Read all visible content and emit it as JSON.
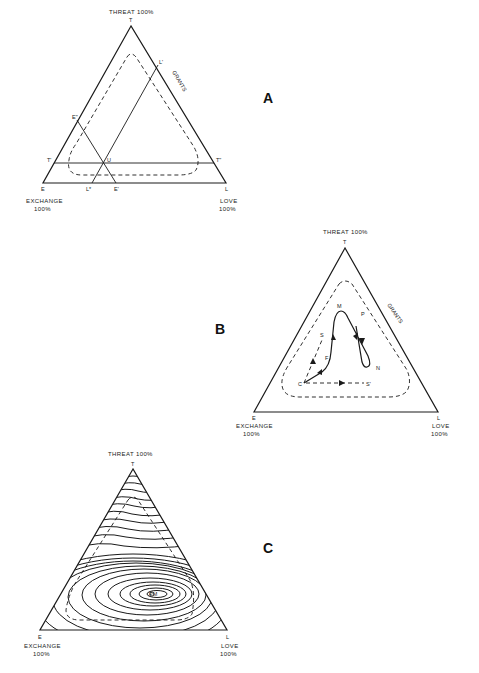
{
  "figure": {
    "panels": [
      {
        "id": "A",
        "letter": "A",
        "top_label": "THREAT 100%",
        "vertex_top": "T",
        "vertex_left": "E",
        "vertex_right": "L",
        "left_caption_1": "EXCHANGE",
        "left_caption_2": "100%",
        "right_caption_1": "LOVE",
        "right_caption_2": "100%",
        "region_label": "GRANTS",
        "points": {
          "t_prime": "T'",
          "u": "U",
          "t_double": "T\"",
          "e_double": "E\"",
          "l_prime": "L'",
          "l_star": "L*",
          "e_prime": "E'"
        }
      },
      {
        "id": "B",
        "letter": "B",
        "top_label": "THREAT 100%",
        "vertex_top": "T",
        "vertex_left": "E",
        "vertex_right": "L",
        "left_caption_1": "EXCHANGE",
        "left_caption_2": "100%",
        "right_caption_1": "LOVE",
        "right_caption_2": "100%",
        "region_label": "GRANTS",
        "points": {
          "m": "M",
          "p": "P",
          "s": "S",
          "f": "F",
          "n": "N",
          "c": "C",
          "s_prime": "S'"
        }
      },
      {
        "id": "C",
        "letter": "C",
        "top_label": "THREAT 100%",
        "vertex_top": "T",
        "vertex_left": "E",
        "vertex_right": "L",
        "left_caption_1": "EXCHANGE",
        "left_caption_2": "100%",
        "right_caption_1": "LOVE",
        "right_caption_2": "100%",
        "peak_label": "PM"
      }
    ]
  }
}
